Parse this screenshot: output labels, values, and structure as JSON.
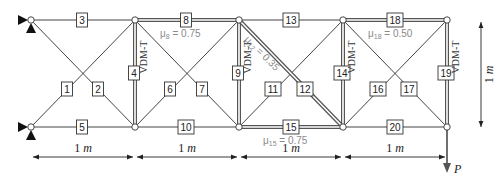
{
  "figure": {
    "type": "truss-diagram",
    "nodes": [
      {
        "id": "T0",
        "x": 31,
        "y": 20
      },
      {
        "id": "T1",
        "x": 135,
        "y": 20
      },
      {
        "id": "T2",
        "x": 239,
        "y": 20
      },
      {
        "id": "T3",
        "x": 343,
        "y": 20
      },
      {
        "id": "T4",
        "x": 447,
        "y": 20
      },
      {
        "id": "B0",
        "x": 31,
        "y": 127
      },
      {
        "id": "B1",
        "x": 135,
        "y": 127
      },
      {
        "id": "B2",
        "x": 239,
        "y": 127
      },
      {
        "id": "B3",
        "x": 343,
        "y": 127
      },
      {
        "id": "B4",
        "x": 447,
        "y": 127
      }
    ],
    "members": [
      {
        "id": "1",
        "label": "1",
        "from": "B0",
        "to": "T1",
        "double": false,
        "lx": 67,
        "ly": 89
      },
      {
        "id": "2",
        "label": "2",
        "from": "T0",
        "to": "B1",
        "double": false,
        "lx": 98,
        "ly": 89
      },
      {
        "id": "3",
        "label": "3",
        "from": "T0",
        "to": "T1",
        "double": false,
        "lx": 82,
        "ly": 20
      },
      {
        "id": "4",
        "label": "4",
        "from": "T1",
        "to": "B1",
        "double": true,
        "lx": 134,
        "ly": 73
      },
      {
        "id": "5",
        "label": "5",
        "from": "B0",
        "to": "B1",
        "double": false,
        "lx": 82,
        "ly": 127
      },
      {
        "id": "6",
        "label": "6",
        "from": "B1",
        "to": "T2",
        "double": false,
        "lx": 170,
        "ly": 89
      },
      {
        "id": "7",
        "label": "7",
        "from": "T1",
        "to": "B2",
        "double": false,
        "lx": 202,
        "ly": 89
      },
      {
        "id": "8",
        "label": "8",
        "from": "T1",
        "to": "T2",
        "double": true,
        "lx": 186,
        "ly": 20
      },
      {
        "id": "9",
        "label": "9",
        "from": "T2",
        "to": "B2",
        "double": true,
        "lx": 238,
        "ly": 73
      },
      {
        "id": "10",
        "label": "10",
        "from": "B1",
        "to": "B2",
        "double": false,
        "lx": 186,
        "ly": 127
      },
      {
        "id": "11",
        "label": "11",
        "from": "B2",
        "to": "T3",
        "double": false,
        "lx": 273,
        "ly": 89
      },
      {
        "id": "12",
        "label": "12",
        "from": "T2",
        "to": "B3",
        "double": true,
        "lx": 305,
        "ly": 89
      },
      {
        "id": "13",
        "label": "13",
        "from": "T2",
        "to": "T3",
        "double": false,
        "lx": 291,
        "ly": 20
      },
      {
        "id": "14",
        "label": "14",
        "from": "T3",
        "to": "B3",
        "double": true,
        "lx": 342,
        "ly": 73
      },
      {
        "id": "15",
        "label": "15",
        "from": "B2",
        "to": "B3",
        "double": true,
        "lx": 291,
        "ly": 127
      },
      {
        "id": "16",
        "label": "16",
        "from": "B3",
        "to": "T4",
        "double": false,
        "lx": 378,
        "ly": 89
      },
      {
        "id": "17",
        "label": "17",
        "from": "T3",
        "to": "B4",
        "double": false,
        "lx": 409,
        "ly": 89
      },
      {
        "id": "18",
        "label": "18",
        "from": "T3",
        "to": "T4",
        "double": true,
        "lx": 395,
        "ly": 20
      },
      {
        "id": "19",
        "label": "19",
        "from": "T4",
        "to": "B4",
        "double": true,
        "lx": 446,
        "ly": 73
      },
      {
        "id": "20",
        "label": "20",
        "from": "B3",
        "to": "B4",
        "double": false,
        "lx": 395,
        "ly": 127
      }
    ],
    "annotations": {
      "mu8": {
        "text": "μ8 = 0.75",
        "base": "μ",
        "sub": "8",
        "value": " = 0.75",
        "x": 160,
        "y": 37
      },
      "mu12": {
        "text": "μ12 = 0.35",
        "base": "μ",
        "sub": "12",
        "value": " = 0.35",
        "x": 244,
        "y": 40
      },
      "mu15": {
        "text": "μ15 = 0.75",
        "base": "μ",
        "sub": "15",
        "value": " = 0.75",
        "x": 263,
        "y": 144
      },
      "mu18": {
        "text": "μ18 = 0.50",
        "base": "μ",
        "sub": "18",
        "value": " = 0.50",
        "x": 368,
        "y": 37
      }
    },
    "vdm_labels": [
      {
        "member": "4",
        "text": "VDM-T",
        "x": 147,
        "y": 57
      },
      {
        "member": "9",
        "text": "VDM-T",
        "x": 251,
        "y": 57
      },
      {
        "member": "14",
        "text": "VDM-T",
        "x": 355,
        "y": 57
      },
      {
        "member": "19",
        "text": "VDM-T",
        "x": 459,
        "y": 57
      }
    ],
    "dimensions": {
      "spans": [
        {
          "value": "1",
          "unit": "m",
          "x1": 31,
          "x2": 135
        },
        {
          "value": "1",
          "unit": "m",
          "x1": 135,
          "x2": 239
        },
        {
          "value": "1",
          "unit": "m",
          "x1": 239,
          "x2": 343
        },
        {
          "value": "1",
          "unit": "m",
          "x1": 343,
          "x2": 447
        }
      ],
      "height": {
        "value": "1",
        "unit": "m",
        "y1": 22,
        "y2": 127
      }
    },
    "load": {
      "label": "P",
      "node": "B4"
    },
    "supports": [
      {
        "node": "T0",
        "type": "pin"
      },
      {
        "node": "B0",
        "type": "pin"
      }
    ]
  }
}
